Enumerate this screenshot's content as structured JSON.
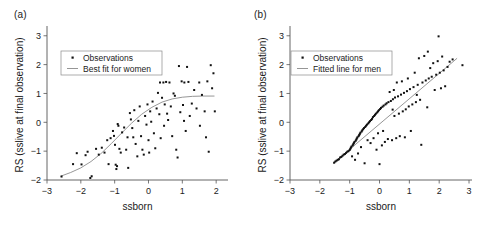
{
  "figure": {
    "background": "#ffffff",
    "point_color": "#111111",
    "line_color": "#8a8a8a",
    "axis_color": "#555555"
  },
  "panels": [
    {
      "tag": "(a)",
      "name": "panel-a-women",
      "xlabel": "ssborn",
      "ylabel": "RS (sslive at final observation)",
      "xticks": [
        -3,
        -2,
        -1,
        0,
        1,
        2
      ],
      "yticks": [
        -2,
        -1,
        0,
        1,
        2,
        3
      ],
      "xlim": [
        -3,
        2.35
      ],
      "ylim": [
        -2,
        3.2
      ],
      "legend": {
        "observations": "Observations",
        "fit": "Best fit for women"
      }
    },
    {
      "tag": "(b)",
      "name": "panel-b-men",
      "xlabel": "ssborn",
      "ylabel": "RS (sslive at final observation)",
      "xticks": [
        -3,
        -2,
        -1,
        0,
        1,
        2,
        3
      ],
      "yticks": [
        -2,
        -1,
        0,
        1,
        2,
        3
      ],
      "xlim": [
        -3,
        3.1
      ],
      "ylim": [
        -2,
        3.2
      ],
      "legend": {
        "observations": "Observations",
        "fit": "Fitted line for men"
      }
    }
  ],
  "chart_data": [
    {
      "type": "scatter",
      "panel": "(a)",
      "title": "",
      "xlabel": "ssborn",
      "ylabel": "RS (sslive at final observation)",
      "xlim": [
        -3,
        2.35
      ],
      "ylim": [
        -2,
        3.2
      ],
      "xticks": [
        -3,
        -2,
        -1,
        0,
        1,
        2
      ],
      "yticks": [
        -2,
        -1,
        0,
        1,
        2,
        3
      ],
      "grid": false,
      "legend_position": "upper-left",
      "series": [
        {
          "name": "Observations",
          "marker": "square",
          "points": [
            [
              -2.57,
              -1.88
            ],
            [
              -2.23,
              -1.45
            ],
            [
              -2.12,
              -1.07
            ],
            [
              -1.98,
              -1.46
            ],
            [
              -1.86,
              -1.14
            ],
            [
              -1.8,
              -1.02
            ],
            [
              -1.72,
              -1.93
            ],
            [
              -1.68,
              -1.87
            ],
            [
              -1.55,
              -0.92
            ],
            [
              -1.47,
              -1.12
            ],
            [
              -1.38,
              -0.88
            ],
            [
              -1.3,
              -1.05
            ],
            [
              -1.22,
              -0.62
            ],
            [
              -1.12,
              -0.55
            ],
            [
              -1.05,
              -0.3
            ],
            [
              -1.02,
              -0.47
            ],
            [
              -0.99,
              -0.78
            ],
            [
              -0.97,
              -1.47
            ],
            [
              -0.95,
              -1.62
            ],
            [
              -0.93,
              -1.52
            ],
            [
              -0.91,
              -0.06
            ],
            [
              -0.89,
              -0.12
            ],
            [
              -0.86,
              -0.92
            ],
            [
              -0.82,
              -1.05
            ],
            [
              -0.78,
              -0.35
            ],
            [
              -0.72,
              -0.18
            ],
            [
              -0.66,
              -0.95
            ],
            [
              -0.6,
              -1.58
            ],
            [
              -0.55,
              0.32
            ],
            [
              -0.52,
              0.1
            ],
            [
              -0.48,
              -0.2
            ],
            [
              -0.45,
              -0.52
            ],
            [
              -0.42,
              0.42
            ],
            [
              -0.38,
              -0.75
            ],
            [
              -0.33,
              -1.18
            ],
            [
              -0.3,
              0.05
            ],
            [
              -0.26,
              0.55
            ],
            [
              -0.22,
              -0.48
            ],
            [
              -0.18,
              -0.95
            ],
            [
              -0.14,
              -1.12
            ],
            [
              -0.1,
              0.22
            ],
            [
              -0.06,
              -0.08
            ],
            [
              -0.03,
              0.62
            ],
            [
              0.0,
              -0.62
            ],
            [
              0.02,
              -1.05
            ],
            [
              0.05,
              0.38
            ],
            [
              0.08,
              0.02
            ],
            [
              0.12,
              0.72
            ],
            [
              0.16,
              -0.38
            ],
            [
              0.2,
              -0.9
            ],
            [
              0.24,
              0.48
            ],
            [
              0.28,
              1.02
            ],
            [
              0.32,
              0.28
            ],
            [
              0.36,
              -0.55
            ],
            [
              0.4,
              0.85
            ],
            [
              0.44,
              1.38
            ],
            [
              0.48,
              0.62
            ],
            [
              0.52,
              1.4
            ],
            [
              0.55,
              0.3
            ],
            [
              0.58,
              0.08
            ],
            [
              0.62,
              1.38
            ],
            [
              0.66,
              0.55
            ],
            [
              0.7,
              -0.48
            ],
            [
              0.74,
              1.0
            ],
            [
              0.78,
              0.92
            ],
            [
              0.82,
              -0.95
            ],
            [
              0.86,
              -1.22
            ],
            [
              0.9,
              1.95
            ],
            [
              0.94,
              0.35
            ],
            [
              0.98,
              1.42
            ],
            [
              1.02,
              0.6
            ],
            [
              1.06,
              1.38
            ],
            [
              1.1,
              -0.3
            ],
            [
              1.14,
              1.92
            ],
            [
              1.18,
              1.4
            ],
            [
              1.22,
              0.22
            ],
            [
              1.28,
              0.65
            ],
            [
              1.35,
              1.12
            ],
            [
              1.42,
              0.48
            ],
            [
              1.5,
              1.38
            ],
            [
              1.58,
              0.95
            ],
            [
              1.66,
              0.38
            ],
            [
              1.7,
              -0.52
            ],
            [
              1.74,
              1.42
            ],
            [
              1.78,
              -1.02
            ],
            [
              1.84,
              1.98
            ],
            [
              1.88,
              1.18
            ],
            [
              1.92,
              1.7
            ],
            [
              1.96,
              0.38
            ],
            [
              1.52,
              -0.12
            ],
            [
              0.46,
              -0.12
            ],
            [
              -0.62,
              -0.52
            ],
            [
              -1.18,
              -1.45
            ],
            [
              0.34,
              1.38
            ],
            [
              1.05,
              0.05
            ]
          ]
        },
        {
          "name": "Best fit for women",
          "type": "line",
          "shape": "sigmoid",
          "points": [
            [
              -2.6,
              -1.87
            ],
            [
              -2.3,
              -1.74
            ],
            [
              -2.0,
              -1.58
            ],
            [
              -1.7,
              -1.36
            ],
            [
              -1.4,
              -1.08
            ],
            [
              -1.1,
              -0.74
            ],
            [
              -0.8,
              -0.38
            ],
            [
              -0.5,
              -0.03
            ],
            [
              -0.2,
              0.28
            ],
            [
              0.1,
              0.52
            ],
            [
              0.4,
              0.7
            ],
            [
              0.7,
              0.81
            ],
            [
              1.0,
              0.87
            ],
            [
              1.3,
              0.9
            ],
            [
              1.6,
              0.91
            ],
            [
              1.95,
              0.91
            ]
          ]
        }
      ]
    },
    {
      "type": "scatter",
      "panel": "(b)",
      "title": "",
      "xlabel": "ssborn",
      "ylabel": "RS (sslive at final observation)",
      "xlim": [
        -3,
        3.1
      ],
      "ylim": [
        -2,
        3.2
      ],
      "xticks": [
        -3,
        -2,
        -1,
        0,
        1,
        2,
        3
      ],
      "yticks": [
        -2,
        -1,
        0,
        1,
        2,
        3
      ],
      "grid": false,
      "legend_position": "upper-left",
      "series": [
        {
          "name": "Observations",
          "marker": "square",
          "points": [
            [
              -1.52,
              -1.4
            ],
            [
              -1.48,
              -1.36
            ],
            [
              -1.44,
              -1.33
            ],
            [
              -1.4,
              -1.3
            ],
            [
              -1.36,
              -1.28
            ],
            [
              -1.32,
              -1.22
            ],
            [
              -1.28,
              -1.2
            ],
            [
              -1.24,
              -1.16
            ],
            [
              -1.2,
              -1.12
            ],
            [
              -1.16,
              -1.1
            ],
            [
              -1.12,
              -1.06
            ],
            [
              -1.08,
              -1.02
            ],
            [
              -1.04,
              -1.0
            ],
            [
              -1.0,
              -0.96
            ],
            [
              -0.98,
              -0.92
            ],
            [
              -0.96,
              -0.88
            ],
            [
              -0.94,
              -0.84
            ],
            [
              -0.92,
              -1.18
            ],
            [
              -0.9,
              -0.8
            ],
            [
              -0.88,
              -0.76
            ],
            [
              -0.86,
              -0.72
            ],
            [
              -0.84,
              -0.68
            ],
            [
              -0.82,
              -1.3
            ],
            [
              -0.8,
              -0.64
            ],
            [
              -0.78,
              -0.6
            ],
            [
              -0.76,
              -0.56
            ],
            [
              -0.74,
              -0.52
            ],
            [
              -0.72,
              -1.08
            ],
            [
              -0.7,
              -0.48
            ],
            [
              -0.68,
              -0.44
            ],
            [
              -0.66,
              -0.4
            ],
            [
              -0.64,
              -0.36
            ],
            [
              -0.62,
              -0.86
            ],
            [
              -0.6,
              -0.32
            ],
            [
              -0.58,
              -0.28
            ],
            [
              -0.55,
              -0.24
            ],
            [
              -0.52,
              -0.2
            ],
            [
              -0.5,
              -1.42
            ],
            [
              -0.48,
              -0.16
            ],
            [
              -0.45,
              -0.12
            ],
            [
              -0.42,
              -0.08
            ],
            [
              -0.4,
              -0.62
            ],
            [
              -0.38,
              -0.04
            ],
            [
              -0.35,
              0.0
            ],
            [
              -0.32,
              0.04
            ],
            [
              -0.3,
              -0.72
            ],
            [
              -0.28,
              0.08
            ],
            [
              -0.25,
              0.12
            ],
            [
              -0.22,
              0.18
            ],
            [
              -0.2,
              -0.55
            ],
            [
              -0.18,
              0.22
            ],
            [
              -0.15,
              0.26
            ],
            [
              -0.12,
              0.3
            ],
            [
              -0.1,
              -0.95
            ],
            [
              -0.08,
              0.34
            ],
            [
              -0.05,
              0.38
            ],
            [
              -0.02,
              0.42
            ],
            [
              0.0,
              -1.45
            ],
            [
              0.02,
              0.46
            ],
            [
              0.05,
              0.5
            ],
            [
              0.08,
              -0.8
            ],
            [
              0.1,
              0.54
            ],
            [
              0.14,
              0.58
            ],
            [
              0.18,
              -0.68
            ],
            [
              0.2,
              0.62
            ],
            [
              0.24,
              0.66
            ],
            [
              0.28,
              -0.58
            ],
            [
              0.3,
              0.7
            ],
            [
              0.34,
              1.05
            ],
            [
              0.38,
              0.74
            ],
            [
              0.42,
              -0.62
            ],
            [
              0.45,
              0.8
            ],
            [
              0.48,
              1.12
            ],
            [
              0.5,
              0.22
            ],
            [
              0.52,
              0.86
            ],
            [
              0.56,
              -0.55
            ],
            [
              0.58,
              1.38
            ],
            [
              0.62,
              0.9
            ],
            [
              0.65,
              0.3
            ],
            [
              0.68,
              -0.48
            ],
            [
              0.72,
              0.96
            ],
            [
              0.75,
              1.42
            ],
            [
              0.78,
              0.38
            ],
            [
              0.82,
              1.02
            ],
            [
              0.85,
              -0.52
            ],
            [
              0.88,
              0.45
            ],
            [
              0.92,
              1.08
            ],
            [
              0.95,
              1.52
            ],
            [
              0.98,
              0.55
            ],
            [
              1.02,
              1.15
            ],
            [
              1.05,
              -0.3
            ],
            [
              1.1,
              0.62
            ],
            [
              1.14,
              1.22
            ],
            [
              1.18,
              1.72
            ],
            [
              1.22,
              0.7
            ],
            [
              1.28,
              1.3
            ],
            [
              1.32,
              2.22
            ],
            [
              1.36,
              0.78
            ],
            [
              1.4,
              -0.78
            ],
            [
              1.44,
              1.38
            ],
            [
              1.5,
              2.3
            ],
            [
              1.55,
              1.45
            ],
            [
              1.6,
              0.52
            ],
            [
              1.65,
              1.52
            ],
            [
              1.7,
              1.88
            ],
            [
              1.75,
              1.58
            ],
            [
              1.8,
              2.05
            ],
            [
              1.85,
              1.12
            ],
            [
              1.9,
              1.65
            ],
            [
              1.95,
              2.12
            ],
            [
              1.98,
              2.98
            ],
            [
              2.02,
              1.72
            ],
            [
              2.06,
              1.18
            ],
            [
              2.1,
              2.28
            ],
            [
              2.15,
              1.8
            ],
            [
              2.2,
              1.25
            ],
            [
              2.28,
              1.92
            ],
            [
              2.35,
              2.1
            ],
            [
              2.45,
              2.18
            ],
            [
              2.78,
              1.98
            ],
            [
              0.44,
              0.44
            ],
            [
              0.12,
              -0.3
            ],
            [
              -0.05,
              -0.38
            ],
            [
              1.25,
              0.95
            ],
            [
              1.62,
              2.45
            ]
          ]
        },
        {
          "name": "Fitted line for men",
          "type": "line",
          "shape": "linear",
          "points": [
            [
              -1.55,
              -1.42
            ],
            [
              2.6,
              2.22
            ]
          ]
        }
      ]
    }
  ]
}
